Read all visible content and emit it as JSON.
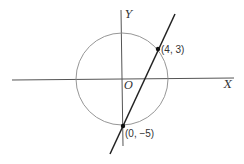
{
  "diagram": {
    "axes": {
      "x_label": "X",
      "y_label": "Y",
      "origin_label": "O"
    },
    "circle": {
      "center": [
        0,
        0
      ],
      "radius": 5
    },
    "line": {
      "through": [
        [
          4,
          3
        ],
        [
          0,
          -5
        ]
      ]
    },
    "points": [
      {
        "label": "(4, 3)",
        "coords": [
          4,
          3
        ]
      },
      {
        "label": "(0, −5)",
        "coords": [
          0,
          -5
        ]
      }
    ],
    "colors": {
      "axes": "#555555",
      "circle": "#8a8a8a",
      "line": "#222222",
      "points": "#111111"
    }
  }
}
